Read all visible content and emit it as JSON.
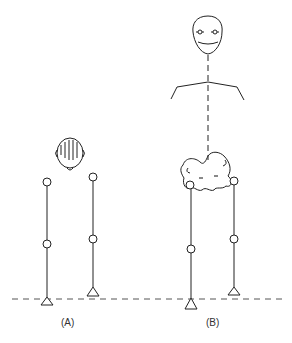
{
  "figure": {
    "panels": [
      {
        "id": "A",
        "label": "(A)",
        "description": "Top view of head with two legs (stick joints) standing on ground line, one foot slightly forward"
      },
      {
        "id": "B",
        "label": "(B)",
        "description": "Front face, shoulders, dashed trunk line, pelvis (sacrum) shape with two hip joints, legs with knee joints and feet"
      }
    ],
    "ground_line": "dashed",
    "colors": {
      "stroke": "#222222",
      "marks": "#888888",
      "background": "#ffffff"
    }
  }
}
